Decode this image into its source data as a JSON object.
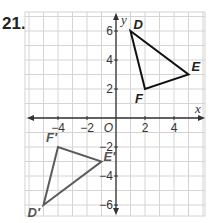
{
  "problem": {
    "number": "21."
  },
  "graph": {
    "x_axis_label": "x",
    "y_axis_label": "y",
    "origin_label": "O",
    "x_ticks": [
      {
        "value": -4,
        "label": "−4"
      },
      {
        "value": -2,
        "label": "−2"
      },
      {
        "value": 2,
        "label": "2"
      },
      {
        "value": 4,
        "label": "4"
      }
    ],
    "y_ticks": [
      {
        "value": 6,
        "label": "6"
      },
      {
        "value": 4,
        "label": "4"
      },
      {
        "value": 2,
        "label": "2"
      },
      {
        "value": -2,
        "label": "−2"
      },
      {
        "value": -4,
        "label": "−4"
      },
      {
        "value": -6,
        "label": "−6"
      }
    ],
    "grid": {
      "x_min": -6,
      "x_max": 6,
      "y_min": -7,
      "y_max": 7
    },
    "colors": {
      "grid": "#d4d4d4",
      "axis": "#333333",
      "original": "#111111",
      "image": "#5a5a5a"
    },
    "triangle_original": {
      "vertices": [
        {
          "name": "D",
          "x": 1,
          "y": 6
        },
        {
          "name": "E",
          "x": 5,
          "y": 3
        },
        {
          "name": "F",
          "x": 2,
          "y": 2
        }
      ]
    },
    "triangle_image": {
      "vertices": [
        {
          "name": "D′",
          "x": -5,
          "y": -6
        },
        {
          "name": "E′",
          "x": -1,
          "y": -3
        },
        {
          "name": "F′",
          "x": -4,
          "y": -2
        }
      ]
    }
  }
}
